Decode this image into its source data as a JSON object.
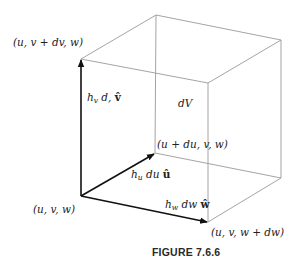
{
  "figure": {
    "caption": "FIGURE 7.6.6",
    "volume_label": "dV",
    "vertices": {
      "origin": "(u, v, w)",
      "u_step": "(u + du, v, w)",
      "v_step": "(u, v + dv, w)",
      "w_step": "(u, v, w + dw)"
    },
    "vectors": {
      "u_vector": {
        "scale": "h",
        "sub": "u",
        "diff": " du ",
        "unit": "û"
      },
      "v_vector": {
        "scale": "h",
        "sub": "v",
        "diff": " d, ",
        "unit": "v̂"
      },
      "w_vector": {
        "scale": "h",
        "sub": "w",
        "diff": " dw ",
        "unit": "ŵ"
      }
    },
    "colors": {
      "edge": "#9a9a9a",
      "vector": "#111111",
      "text": "#222222"
    }
  }
}
